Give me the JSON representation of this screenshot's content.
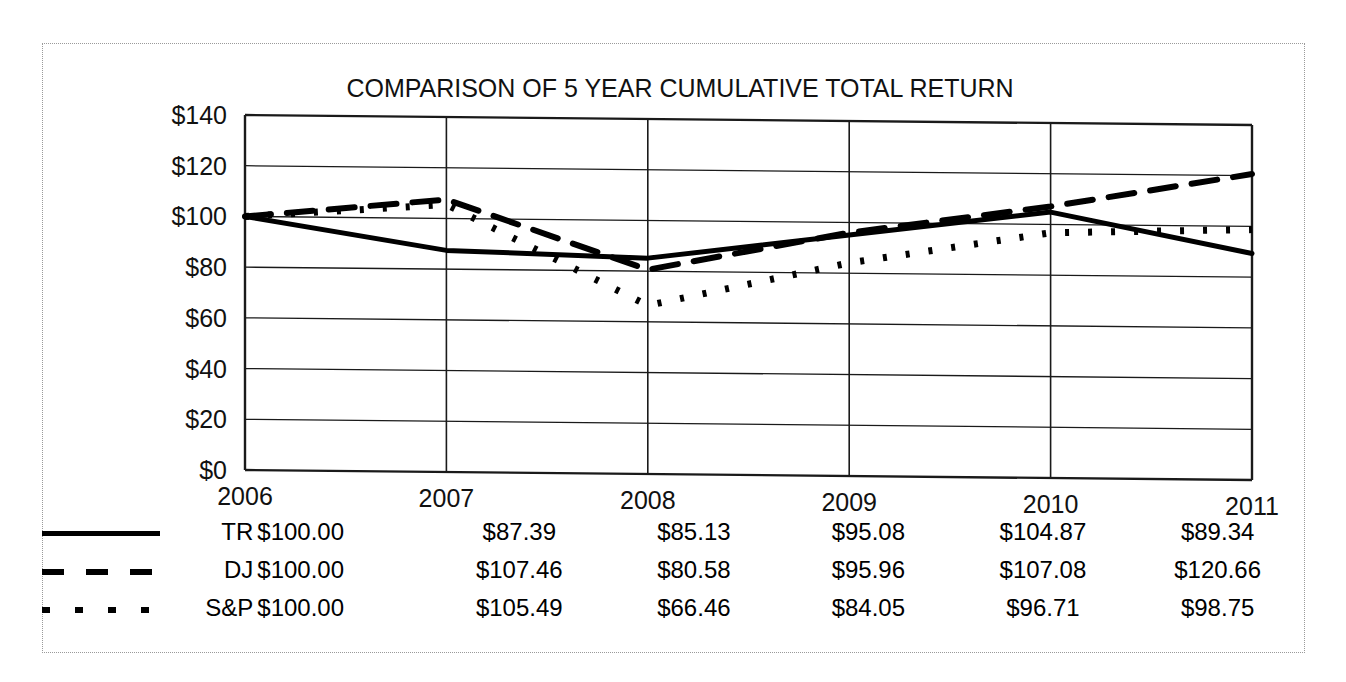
{
  "chart_data": {
    "type": "line",
    "title": "COMPARISON OF 5 YEAR CUMULATIVE TOTAL RETURN",
    "xlabel": "",
    "ylabel": "",
    "categories": [
      "2006",
      "2007",
      "2008",
      "2009",
      "2010",
      "2011"
    ],
    "ylim": [
      0,
      140
    ],
    "ytick_values": [
      0,
      20,
      40,
      60,
      80,
      100,
      120,
      140
    ],
    "ytick_labels": [
      "$0",
      "$20",
      "$40",
      "$60",
      "$80",
      "$100",
      "$120",
      "$140"
    ],
    "grid": true,
    "legend_position": "below-table",
    "series": [
      {
        "name": "TR",
        "style": "solid",
        "values": [
          100.0,
          87.39,
          85.13,
          95.08,
          104.87,
          89.34
        ],
        "labels": [
          "$100.00",
          "$87.39",
          "$85.13",
          "$95.08",
          "$104.87",
          "$89.34"
        ]
      },
      {
        "name": "DJ",
        "style": "dashed",
        "values": [
          100.0,
          107.46,
          80.58,
          95.96,
          107.08,
          120.66
        ],
        "labels": [
          "$100.00",
          "$107.46",
          "$80.58",
          "$95.96",
          "$107.08",
          "$120.66"
        ]
      },
      {
        "name": "S&P",
        "style": "dotted",
        "values": [
          100.0,
          105.49,
          66.46,
          84.05,
          96.71,
          98.75
        ],
        "labels": [
          "$100.00",
          "$105.49",
          "$66.46",
          "$84.05",
          "$96.71",
          "$98.75"
        ]
      }
    ]
  },
  "axis": {
    "y_labels": [
      "$140",
      "$120",
      "$100",
      "$80",
      "$60",
      "$40",
      "$20",
      "$0"
    ],
    "x_labels": [
      "2006",
      "2007",
      "2008",
      "2009",
      "2010",
      "2011"
    ]
  },
  "table": {
    "rows": [
      {
        "marker": "solid-line-marker",
        "name": "TR",
        "cells": [
          "$100.00",
          "$87.39",
          "$85.13",
          "$95.08",
          "$104.87",
          "$89.34"
        ]
      },
      {
        "marker": "dashed-line-marker",
        "name": "DJ",
        "cells": [
          "$100.00",
          "$107.46",
          "$80.58",
          "$95.96",
          "$107.08",
          "$120.66"
        ]
      },
      {
        "marker": "dotted-line-marker",
        "name": "S&P",
        "cells": [
          "$100.00",
          "$105.49",
          "$66.46",
          "$84.05",
          "$96.71",
          "$98.75"
        ]
      }
    ]
  },
  "colors": {
    "line": "#000000",
    "grid": "#1a1a1a",
    "frame": "#9a9a9a",
    "background": "#ffffff"
  }
}
